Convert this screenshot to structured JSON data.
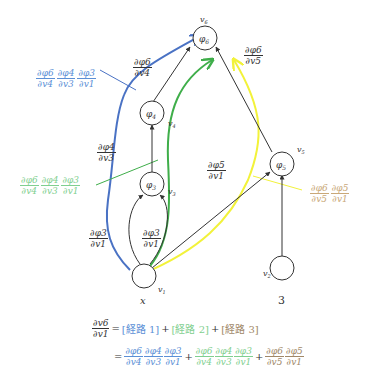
{
  "colors": {
    "path1": "#4a72c4",
    "path2": "#3fae4a",
    "path3": "#f2f23a",
    "path1_text": "#5b8fd6",
    "path2_text": "#7fcf8f",
    "path3_text": "#c9a878",
    "edge": "#333333"
  },
  "nodes": {
    "phi6": {
      "label": "φ6",
      "name": "v6"
    },
    "phi4": {
      "label": "φ4",
      "name": "v4"
    },
    "phi3": {
      "label": "φ3",
      "name": "v3"
    },
    "phi5": {
      "label": "φ5",
      "name": "v5"
    },
    "v1": {
      "name": "v1",
      "value": "x"
    },
    "v2": {
      "name": "v2",
      "value": "3"
    }
  },
  "edge_labels": {
    "d_phi6_v4": {
      "num": "∂φ6",
      "den": "∂v4"
    },
    "d_phi6_v5": {
      "num": "∂φ6",
      "den": "∂v5"
    },
    "d_phi4_v3": {
      "num": "∂φ4",
      "den": "∂v3"
    },
    "d_phi5_v1": {
      "num": "∂φ5",
      "den": "∂v1"
    },
    "d_phi3_v1_left": {
      "num": "∂φ3",
      "den": "∂v1"
    },
    "d_phi3_v1_right": {
      "num": "∂φ3",
      "den": "∂v1"
    }
  },
  "path_labels": {
    "path1": [
      {
        "num": "∂φ6",
        "den": "∂v4"
      },
      {
        "num": "∂φ4",
        "den": "∂v3"
      },
      {
        "num": "∂φ3",
        "den": "∂v1"
      }
    ],
    "path2": [
      {
        "num": "∂φ6",
        "den": "∂v4"
      },
      {
        "num": "∂φ4",
        "den": "∂v3"
      },
      {
        "num": "∂φ3",
        "den": "∂v1"
      }
    ],
    "path3": [
      {
        "num": "∂φ6",
        "den": "∂v5"
      },
      {
        "num": "∂φ5",
        "den": "∂v1"
      }
    ]
  },
  "equation": {
    "lhs": {
      "num": "∂v6",
      "den": "∂v1"
    },
    "eq": "=",
    "route1": "[経路 1]",
    "route2": "[経路 2]",
    "route3": "[経路 3]",
    "plus": "+"
  }
}
